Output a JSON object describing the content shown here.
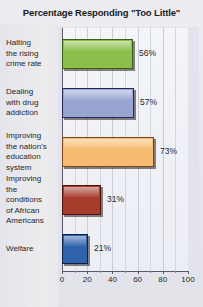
{
  "chart_data": {
    "type": "bar",
    "orientation": "horizontal",
    "title": "Percentage Responding \"Too Little\"",
    "xlabel": "",
    "ylabel": "",
    "xlim": [
      0,
      100
    ],
    "grid": true,
    "legend": "none",
    "tick_labels": [
      "0",
      "20",
      "40",
      "60",
      "80",
      "100"
    ],
    "tick_values": [
      0,
      20,
      40,
      60,
      80,
      100
    ],
    "minor_tick_values": [
      10,
      30,
      50,
      70,
      90
    ],
    "categories": [
      "Halting the rising crime rate",
      "Dealing with drug addiction",
      "Improving the nation's education system",
      "Improving the conditions of African Americans",
      "Welfare"
    ],
    "values": [
      56,
      57,
      73,
      31,
      21
    ],
    "value_labels": [
      "56%",
      "57%",
      "73%",
      "31%",
      "21%"
    ],
    "colors": [
      "#8cbe4c",
      "#9aa4d2",
      "#f6bc72",
      "#a83c2c",
      "#2f63ab"
    ]
  },
  "axis": {
    "ticks": [
      {
        "label": "0",
        "value": 0
      },
      {
        "label": "20",
        "value": 20
      },
      {
        "label": "40",
        "value": 40
      },
      {
        "label": "60",
        "value": 60
      },
      {
        "label": "80",
        "value": 80
      },
      {
        "label": "100",
        "value": 100
      }
    ]
  },
  "bars": [
    {
      "label_lines": [
        "Halting",
        "the rising",
        "crime rate"
      ],
      "value": 56,
      "value_label": "56%",
      "color": "#8cbe4c",
      "edge": "#3f5f18"
    },
    {
      "label_lines": [
        "Dealing",
        "with drug",
        "addiction"
      ],
      "value": 57,
      "value_label": "57%",
      "color": "#9aa4d2",
      "edge": "#262a5c"
    },
    {
      "label_lines": [
        "Improving",
        "the nation's",
        "education",
        "system"
      ],
      "value": 73,
      "value_label": "73%",
      "color": "#f6bc72",
      "edge": "#7c4418"
    },
    {
      "label_lines": [
        "Improving",
        "the",
        "conditions",
        "of African",
        "Americans"
      ],
      "value": 31,
      "value_label": "31%",
      "color": "#a83c2c",
      "edge": "#4d140c"
    },
    {
      "label_lines": [
        "Welfare"
      ],
      "value": 21,
      "value_label": "21%",
      "color": "#2f63ab",
      "edge": "#101f46"
    }
  ]
}
